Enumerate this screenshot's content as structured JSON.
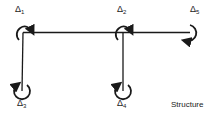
{
  "diagram": {
    "caption": "Structure",
    "stroke_color": "#1a1a1a",
    "members": [
      {
        "id": "beam",
        "type": "horizontal",
        "from": [
          24,
          33
        ],
        "to": [
          190,
          33
        ]
      },
      {
        "id": "col-left",
        "type": "vertical",
        "from": [
          24,
          33
        ],
        "to": [
          22,
          90
        ]
      },
      {
        "id": "col-mid",
        "type": "vertical",
        "from": [
          123,
          33
        ],
        "to": [
          123,
          90
        ]
      }
    ],
    "rotations": [
      {
        "id": "d1",
        "symbol": "Δ",
        "sub": "1",
        "at": [
          24,
          33
        ]
      },
      {
        "id": "d2",
        "symbol": "Δ",
        "sub": "2",
        "at": [
          123,
          33
        ]
      },
      {
        "id": "d5",
        "symbol": "Δ",
        "sub": "5",
        "at": [
          190,
          33
        ]
      },
      {
        "id": "d3",
        "symbol": "Δ",
        "sub": "3",
        "at": [
          22,
          90
        ]
      },
      {
        "id": "d4",
        "symbol": "Δ",
        "sub": "4",
        "at": [
          123,
          90
        ]
      }
    ]
  }
}
